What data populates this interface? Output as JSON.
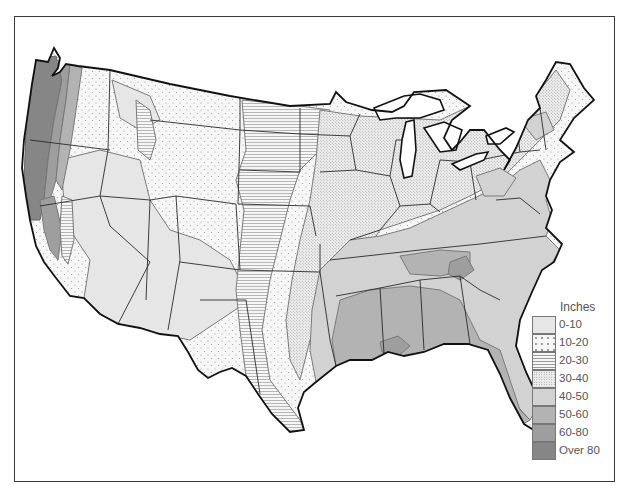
{
  "map": {
    "subject": "Average annual precipitation, contiguous United States",
    "projection": "conic outline",
    "colors": {
      "frame": "#3a3a3a",
      "state_border": "#2a2a2a",
      "coast": "#111111",
      "water": "#ffffff",
      "contour": "#777777"
    }
  },
  "legend": {
    "title": "Inches",
    "items": [
      {
        "label": "0-10",
        "fill": "#e6e6e6",
        "pattern": "solid"
      },
      {
        "label": "10-20",
        "fill": "#f4f4f4",
        "pattern": "sparse-dots"
      },
      {
        "label": "20-30",
        "fill": "#f2f2f2",
        "pattern": "horizontal-lines"
      },
      {
        "label": "30-40",
        "fill": "#e8e8e8",
        "pattern": "dense-dots"
      },
      {
        "label": "40-50",
        "fill": "#d2d2d2",
        "pattern": "solid"
      },
      {
        "label": "50-60",
        "fill": "#b3b3b3",
        "pattern": "solid"
      },
      {
        "label": "60-80",
        "fill": "#9e9e9e",
        "pattern": "solid"
      },
      {
        "label": "Over 80",
        "fill": "#868686",
        "pattern": "solid"
      }
    ]
  }
}
